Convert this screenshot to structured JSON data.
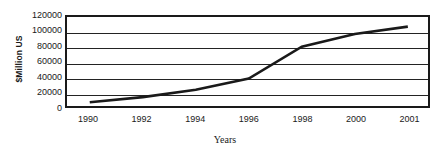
{
  "chart_data": {
    "type": "line",
    "title": "",
    "xlabel": "Years",
    "ylabel": "$Million US",
    "categories": [
      "1990",
      "1992",
      "1994",
      "1996",
      "1998",
      "2000",
      "2001"
    ],
    "x": [
      1990,
      1992,
      1994,
      1996,
      1998,
      2000,
      2001
    ],
    "values": [
      5000,
      12000,
      22000,
      37000,
      80000,
      97000,
      107000
    ],
    "series": [
      {
        "name": "",
        "values": [
          5000,
          12000,
          22000,
          37000,
          80000,
          97000,
          107000
        ]
      }
    ],
    "ylim": [
      0,
      120000
    ],
    "yticks": [
      0,
      20000,
      40000,
      60000,
      80000,
      100000,
      120000
    ],
    "ytick_labels": [
      "0",
      "20000",
      "40000",
      "60000",
      "80000",
      "100000",
      "120000"
    ],
    "xtick_labels": [
      "1990",
      "1992",
      "1994",
      "1996",
      "1998",
      "2000",
      "2001"
    ],
    "grid": "horizontal",
    "legend": "none",
    "line_color": "#1a1a1a",
    "plot_border_color": "#1a1a1a",
    "background_color": "#ffffff",
    "annotations": []
  },
  "axes": {
    "y_title": "$Million US",
    "x_title": "Years"
  }
}
